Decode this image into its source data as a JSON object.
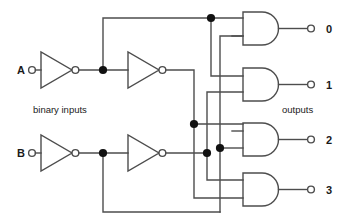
{
  "diagram": {
    "type": "logic-circuit",
    "colors": {
      "wire": "#4d4d4d",
      "junction_dot": "#111111",
      "text": "#1a1a1a",
      "background": "#ffffff"
    },
    "captions": {
      "inputs_caption": "binary inputs",
      "outputs_caption": "outputs"
    },
    "inputs": [
      {
        "label": "A",
        "terminal_x": 32,
        "terminal_y": 70
      },
      {
        "label": "B",
        "terminal_x": 32,
        "terminal_y": 153
      }
    ],
    "outputs": [
      {
        "label": "0",
        "terminal_x": 311,
        "terminal_y": 28
      },
      {
        "label": "1",
        "terminal_x": 311,
        "terminal_y": 84
      },
      {
        "label": "2",
        "terminal_x": 311,
        "terminal_y": 139
      },
      {
        "label": "3",
        "terminal_x": 311,
        "terminal_y": 189
      }
    ],
    "inverters": [
      {
        "name": "inverter-a1",
        "x": 41,
        "y": 70
      },
      {
        "name": "inverter-a2",
        "x": 128,
        "y": 70
      },
      {
        "name": "inverter-b1",
        "x": 41,
        "y": 153
      },
      {
        "name": "inverter-b2",
        "x": 128,
        "y": 153
      }
    ],
    "and_gates": [
      {
        "name": "and-gate-0",
        "output_index": "0",
        "x": 243,
        "y": 28
      },
      {
        "name": "and-gate-1",
        "output_index": "1",
        "x": 243,
        "y": 84
      },
      {
        "name": "and-gate-2",
        "output_index": "2",
        "x": 243,
        "y": 139
      },
      {
        "name": "and-gate-3",
        "output_index": "3",
        "x": 243,
        "y": 189
      }
    ],
    "junction_dots": [
      {
        "name": "junction-a-notA",
        "x": 103,
        "y": 70
      },
      {
        "name": "junction-b-notB",
        "x": 103,
        "y": 153
      },
      {
        "name": "junction-top-bus",
        "x": 211,
        "y": 18
      },
      {
        "name": "junction-mid-bus",
        "x": 194,
        "y": 124
      },
      {
        "name": "junction-low-bus-a",
        "x": 207,
        "y": 153
      },
      {
        "name": "junction-low-bus-b",
        "x": 220,
        "y": 148
      }
    ]
  }
}
